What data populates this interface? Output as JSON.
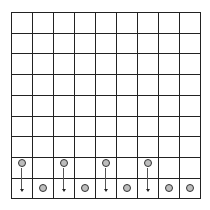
{
  "board": {
    "rows": 9,
    "cols": 9,
    "cell_w": 21,
    "cell_h": 20.7,
    "line_color": "#222222",
    "piece_color": "#bdbdbd"
  },
  "pieces": [
    {
      "row": 7,
      "col": 0
    },
    {
      "row": 7,
      "col": 2
    },
    {
      "row": 7,
      "col": 4
    },
    {
      "row": 7,
      "col": 6
    },
    {
      "row": 8,
      "col": 1
    },
    {
      "row": 8,
      "col": 3
    },
    {
      "row": 8,
      "col": 5
    },
    {
      "row": 8,
      "col": 7
    },
    {
      "row": 8,
      "col": 8
    }
  ],
  "arrows": [
    {
      "from": [
        7,
        0
      ],
      "to": [
        8,
        0
      ],
      "direction": "down"
    },
    {
      "from": [
        7,
        2
      ],
      "to": [
        8,
        2
      ],
      "direction": "down"
    },
    {
      "from": [
        7,
        4
      ],
      "to": [
        8,
        4
      ],
      "direction": "down"
    },
    {
      "from": [
        7,
        6
      ],
      "to": [
        8,
        6
      ],
      "direction": "down"
    }
  ]
}
